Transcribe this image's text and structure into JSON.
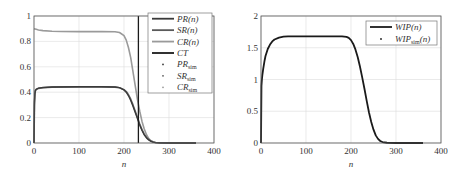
{
  "chart_data": [
    {
      "type": "line",
      "title": "",
      "xlabel": "n",
      "ylabel": "",
      "xlim": [
        0,
        400
      ],
      "ylim": [
        0,
        1
      ],
      "xticks": [
        0,
        100,
        200,
        300,
        400
      ],
      "yticks": [
        0,
        0.2,
        0.4,
        0.6,
        0.8,
        1
      ],
      "ytick_labels": [
        "0",
        "0.2",
        "0.4",
        "0.6",
        "0.8",
        "1"
      ],
      "grid": true,
      "legend_position": "upper right",
      "legend": [
        {
          "label": "PR(n)",
          "sub": "",
          "tail": "",
          "style": "line",
          "color": "#3a3a3a"
        },
        {
          "label": "SR(n)",
          "sub": "",
          "tail": "",
          "style": "line",
          "color": "#5a5a5a"
        },
        {
          "label": "CR(n)",
          "sub": "",
          "tail": "",
          "style": "line",
          "color": "#9a9a9a"
        },
        {
          "label": "CT",
          "sub": "",
          "tail": "",
          "style": "line",
          "color": "#1a1a1a"
        },
        {
          "label": "PR",
          "sub": "sim",
          "tail": "",
          "style": "dot",
          "color": "#3a3a3a"
        },
        {
          "label": "SR",
          "sub": "sim",
          "tail": "",
          "style": "dot",
          "color": "#5a5a5a"
        },
        {
          "label": "CR",
          "sub": "sim",
          "tail": "",
          "style": "dot",
          "color": "#9a9a9a"
        }
      ],
      "vertical_line": {
        "name": "CT",
        "x": 232
      },
      "series": [
        {
          "name": "CR(n)",
          "color": "#9a9a9a",
          "width": 1.6,
          "x": [
            0,
            5,
            10,
            20,
            40,
            60,
            100,
            150,
            180,
            190,
            200,
            205,
            210,
            215,
            220,
            225,
            230,
            235,
            240,
            245,
            250,
            255,
            260,
            265,
            270,
            280,
            300,
            330,
            360
          ],
          "y": [
            0.9,
            0.895,
            0.89,
            0.885,
            0.88,
            0.878,
            0.877,
            0.877,
            0.876,
            0.87,
            0.845,
            0.81,
            0.75,
            0.67,
            0.56,
            0.45,
            0.34,
            0.25,
            0.17,
            0.11,
            0.065,
            0.035,
            0.018,
            0.008,
            0.004,
            0.001,
            0.0,
            0.0,
            0.0
          ]
        },
        {
          "name": "SR(n)",
          "color": "#6a6a6a",
          "width": 1.6,
          "x": [
            0,
            1,
            2,
            3,
            5,
            10,
            20,
            40,
            100,
            150,
            180,
            190,
            200,
            205,
            210,
            215,
            220,
            225,
            230,
            235,
            240,
            245,
            250,
            255,
            260,
            265,
            270,
            280,
            300,
            330,
            360
          ],
          "y": [
            0.0,
            0.3,
            0.38,
            0.41,
            0.42,
            0.43,
            0.435,
            0.44,
            0.442,
            0.442,
            0.44,
            0.435,
            0.42,
            0.405,
            0.38,
            0.345,
            0.3,
            0.25,
            0.2,
            0.15,
            0.105,
            0.07,
            0.045,
            0.027,
            0.015,
            0.008,
            0.004,
            0.001,
            0.0,
            0.0,
            0.0
          ]
        },
        {
          "name": "PR(n)",
          "color": "#3a3a3a",
          "width": 1.4,
          "x": [
            0,
            1,
            2,
            3,
            5,
            10,
            20,
            40,
            100,
            150,
            180,
            190,
            200,
            205,
            210,
            215,
            220,
            225,
            230,
            235,
            240,
            245,
            250,
            255,
            260,
            265,
            270,
            280,
            300,
            330,
            360
          ],
          "y": [
            0.0,
            0.32,
            0.39,
            0.415,
            0.425,
            0.432,
            0.437,
            0.441,
            0.443,
            0.443,
            0.441,
            0.436,
            0.418,
            0.4,
            0.372,
            0.335,
            0.29,
            0.24,
            0.19,
            0.14,
            0.098,
            0.064,
            0.04,
            0.024,
            0.013,
            0.007,
            0.003,
            0.001,
            0.0,
            0.0,
            0.0
          ]
        }
      ]
    },
    {
      "type": "line",
      "title": "",
      "xlabel": "n",
      "ylabel": "",
      "xlim": [
        0,
        400
      ],
      "ylim": [
        0,
        2
      ],
      "xticks": [
        0,
        100,
        200,
        300,
        400
      ],
      "yticks": [
        0,
        0.5,
        1,
        1.5,
        2
      ],
      "ytick_labels": [
        "0",
        "0.5",
        "1",
        "1.5",
        "2"
      ],
      "grid": true,
      "legend_position": "upper right",
      "legend": [
        {
          "label": "WIP(n)",
          "sub": "",
          "tail": "",
          "style": "line",
          "color": "#1a1a1a"
        },
        {
          "label": "WIP",
          "sub": "sim",
          "tail": "(n)",
          "style": "dot",
          "color": "#1a1a1a"
        }
      ],
      "series": [
        {
          "name": "WIP(n)",
          "color": "#1a1a1a",
          "width": 1.8,
          "x": [
            0,
            1,
            2,
            3,
            5,
            8,
            10,
            15,
            20,
            25,
            30,
            40,
            50,
            60,
            100,
            150,
            180,
            190,
            195,
            200,
            205,
            210,
            215,
            220,
            225,
            230,
            235,
            240,
            245,
            250,
            255,
            260,
            265,
            270,
            280,
            300,
            330,
            360
          ],
          "y": [
            0.0,
            0.9,
            1.0,
            1.07,
            1.17,
            1.3,
            1.37,
            1.48,
            1.55,
            1.6,
            1.63,
            1.66,
            1.675,
            1.68,
            1.68,
            1.68,
            1.678,
            1.67,
            1.655,
            1.62,
            1.56,
            1.47,
            1.35,
            1.2,
            1.03,
            0.85,
            0.66,
            0.48,
            0.33,
            0.21,
            0.12,
            0.065,
            0.032,
            0.015,
            0.004,
            0.0,
            0.0,
            0.0
          ]
        }
      ]
    }
  ]
}
